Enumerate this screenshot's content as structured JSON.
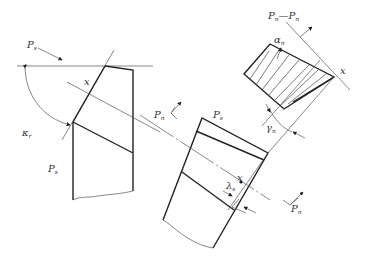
{
  "diagram": {
    "type": "cutting-tool-angle-geometry",
    "labels": {
      "ps_top": {
        "main": "P",
        "sub": "s"
      },
      "ps_bottom": {
        "main": "P",
        "sub": "s"
      },
      "ps_middle": {
        "main": "P",
        "sub": "s"
      },
      "pn_left": {
        "main": "P",
        "sub": "n"
      },
      "pn_bottom_right": {
        "main": "P",
        "sub": "n"
      },
      "section_title": {
        "a": "P",
        "a_sub": "n",
        "dash": "—",
        "b": "P",
        "b_sub": "n"
      },
      "kappa_r": {
        "main": "κ",
        "sub": "r"
      },
      "x_left": "x",
      "x_middle": "x",
      "x_right": "x",
      "alpha_n": {
        "main": "α",
        "sub": "n"
      },
      "gamma_n": {
        "main": "γ",
        "sub": "n"
      },
      "lambda_s": {
        "main": "λ",
        "sub": "s"
      }
    },
    "colors": {
      "line": "#222222",
      "thin": "#555555",
      "text": "#333333",
      "background": "#ffffff"
    }
  }
}
